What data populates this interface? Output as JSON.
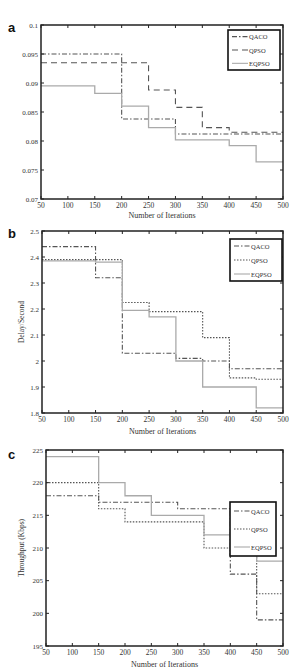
{
  "chart_data": [
    {
      "panel": "a",
      "type": "line",
      "step": true,
      "title": "",
      "xlabel": "Number of Iterations",
      "ylabel": "",
      "xlim": [
        50,
        500
      ],
      "ylim": [
        0.07,
        0.1
      ],
      "xticks": [
        50,
        100,
        150,
        200,
        250,
        300,
        350,
        400,
        450,
        500
      ],
      "yticks": [
        0.07,
        0.075,
        0.08,
        0.085,
        0.09,
        0.095,
        0.1
      ],
      "ytick_labels": [
        "0.07",
        "0.075",
        "0.08",
        "0.085",
        "0.09",
        "0.095",
        "0.1"
      ],
      "grid": false,
      "legend_position": "upper right",
      "x": [
        50,
        100,
        150,
        200,
        250,
        300,
        350,
        400,
        450,
        500
      ],
      "series": [
        {
          "name": "QACO",
          "style": "dash-dot",
          "values": [
            0.095,
            0.095,
            0.095,
            0.0838,
            0.0838,
            0.0812,
            0.0812,
            0.0812,
            0.0812,
            0.0812
          ]
        },
        {
          "name": "QPSO",
          "style": "dashed",
          "values": [
            0.0935,
            0.0935,
            0.0935,
            0.0935,
            0.0888,
            0.0858,
            0.0823,
            0.0815,
            0.0815,
            0.0815
          ]
        },
        {
          "name": "EQPSO",
          "style": "solid",
          "values": [
            0.0895,
            0.0895,
            0.0882,
            0.086,
            0.0823,
            0.0802,
            0.0802,
            0.0792,
            0.0764,
            0.0764
          ]
        }
      ]
    },
    {
      "panel": "b",
      "type": "line",
      "step": true,
      "title": "",
      "xlabel": "Number of Iterations",
      "ylabel": "Delay/Second",
      "xlim": [
        50,
        500
      ],
      "ylim": [
        1.8,
        2.5
      ],
      "xticks": [
        50,
        100,
        150,
        200,
        250,
        300,
        350,
        400,
        450,
        500
      ],
      "yticks": [
        1.8,
        1.9,
        2.0,
        2.1,
        2.2,
        2.3,
        2.4,
        2.5
      ],
      "ytick_labels": [
        "1.8",
        "1.9",
        "2",
        "2.1",
        "2.2",
        "2.3",
        "2.4",
        "2.5"
      ],
      "grid": false,
      "legend_position": "upper right",
      "x": [
        50,
        100,
        150,
        200,
        250,
        300,
        350,
        400,
        450,
        500
      ],
      "series": [
        {
          "name": "QACO",
          "style": "dash-dot",
          "values": [
            2.44,
            2.44,
            2.32,
            2.03,
            2.03,
            2.01,
            2.0,
            1.97,
            1.97,
            1.97
          ]
        },
        {
          "name": "QPSO",
          "style": "dotted",
          "values": [
            2.39,
            2.39,
            2.39,
            2.225,
            2.19,
            2.19,
            2.09,
            1.935,
            1.93,
            1.93
          ]
        },
        {
          "name": "EQPSO",
          "style": "solid",
          "values": [
            2.385,
            2.385,
            2.38,
            2.195,
            2.17,
            2.0,
            1.9,
            1.9,
            1.82,
            1.82
          ]
        }
      ]
    },
    {
      "panel": "c",
      "type": "line",
      "step": true,
      "title": "",
      "xlabel": "Number of Iterations",
      "ylabel": "Throughput (Kbps)",
      "xlim": [
        50,
        500
      ],
      "ylim": [
        195,
        225
      ],
      "xticks": [
        50,
        100,
        150,
        200,
        250,
        300,
        350,
        400,
        450,
        500
      ],
      "yticks": [
        195,
        200,
        205,
        210,
        215,
        220,
        225
      ],
      "ytick_labels": [
        "195",
        "200",
        "205",
        "210",
        "215",
        "220",
        "225"
      ],
      "grid": false,
      "legend_position": "upper right",
      "x": [
        50,
        100,
        150,
        200,
        250,
        300,
        350,
        400,
        450,
        500
      ],
      "series": [
        {
          "name": "QACO",
          "style": "dash-dot",
          "values": [
            218,
            218,
            217,
            217,
            217,
            216,
            216,
            206,
            199,
            199
          ]
        },
        {
          "name": "QPSO",
          "style": "dotted",
          "values": [
            220,
            220,
            216,
            214,
            214,
            214,
            210,
            209,
            203,
            203
          ]
        },
        {
          "name": "EQPSO",
          "style": "solid",
          "values": [
            224,
            224,
            220,
            218,
            215,
            215,
            212,
            212,
            208,
            208
          ]
        }
      ]
    }
  ],
  "panels": {
    "a": {
      "letter": "a",
      "xlabel": "Number of Iterations",
      "ylabel": ""
    },
    "b": {
      "letter": "b",
      "xlabel": "Number of Iterations",
      "ylabel": "Delay/Second"
    },
    "c": {
      "letter": "c",
      "xlabel": "Number of Iterations",
      "ylabel": "Throughput (Kbps)"
    }
  },
  "colors": {
    "axis": "#222222",
    "QACO": "#555555",
    "QPSO": "#555555",
    "EQPSO": "#aaaaaa"
  }
}
